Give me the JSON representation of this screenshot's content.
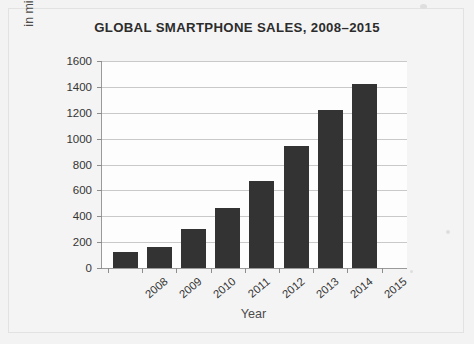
{
  "chart_data": {
    "type": "bar",
    "title": "GLOBAL SMARTPHONE SALES, 2008–2015",
    "xlabel": "Year",
    "ylabel": "in millions of smartphones",
    "categories": [
      "2008",
      "2009",
      "2010",
      "2011",
      "2012",
      "2013",
      "2014",
      "2015"
    ],
    "values": [
      120,
      160,
      300,
      465,
      675,
      940,
      1225,
      1420
    ],
    "series": [
      {
        "name": "Global smartphone sales",
        "values": [
          120,
          160,
          300,
          465,
          675,
          940,
          1225,
          1420
        ]
      }
    ],
    "ylim": [
      0,
      1600
    ],
    "yticks": [
      0,
      200,
      400,
      600,
      800,
      1000,
      1200,
      1400,
      1600
    ],
    "ytick_labels": [
      "0",
      "200",
      "400",
      "600",
      "800",
      "1000",
      "1200",
      "1400",
      "1600"
    ],
    "grid": "horizontal",
    "legend": "none",
    "bar_color": "#333333",
    "plot_background": "#fdfdfd",
    "gridline_color": "#c9c9c9",
    "axis_color": "#9a9a9a",
    "xtick_label_rotation": -40
  }
}
